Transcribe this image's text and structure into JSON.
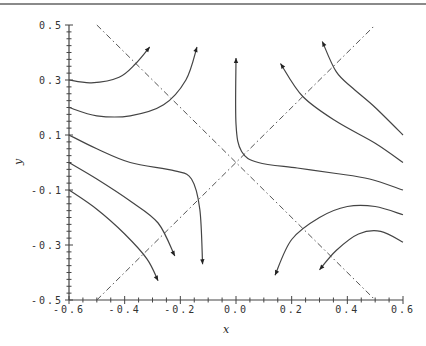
{
  "chart_data": {
    "type": "line",
    "title": "",
    "xlabel": "x",
    "ylabel": "y",
    "xlim": [
      -0.6,
      0.6
    ],
    "ylim": [
      -0.5,
      0.5
    ],
    "grid": false,
    "legend": null,
    "x_ticks": [
      "-0.6",
      "-0.4",
      "-0.2",
      "0.0",
      "0.2",
      "0.4",
      "0.6"
    ],
    "y_ticks": [
      "0.5",
      "0.3",
      "0.1",
      "-0.1",
      "-0.3",
      "-0.5"
    ],
    "reference_lines": [
      {
        "name": "y = x",
        "style": "dash-dot",
        "points": [
          [
            -0.5,
            -0.5
          ],
          [
            0.5,
            0.5
          ]
        ]
      },
      {
        "name": "y = -x",
        "style": "dash-dot",
        "points": [
          [
            -0.5,
            0.5
          ],
          [
            0.5,
            -0.5
          ]
        ]
      }
    ],
    "series": [
      {
        "name": "trajectory-1",
        "arrow": "end",
        "points": [
          [
            -0.6,
            0.3
          ],
          [
            -0.52,
            0.29
          ],
          [
            -0.42,
            0.31
          ],
          [
            -0.36,
            0.36
          ],
          [
            -0.31,
            0.42
          ]
        ]
      },
      {
        "name": "trajectory-2",
        "arrow": "end",
        "points": [
          [
            -0.6,
            0.2
          ],
          [
            -0.5,
            0.17
          ],
          [
            -0.38,
            0.17
          ],
          [
            -0.26,
            0.21
          ],
          [
            -0.18,
            0.3
          ],
          [
            -0.14,
            0.42
          ]
        ]
      },
      {
        "name": "trajectory-3",
        "arrow": "end",
        "points": [
          [
            -0.6,
            0.1
          ],
          [
            -0.5,
            0.05
          ],
          [
            -0.38,
            0.0
          ],
          [
            -0.22,
            -0.03
          ],
          [
            -0.16,
            -0.06
          ],
          [
            -0.13,
            -0.17
          ],
          [
            -0.12,
            -0.37
          ]
        ]
      },
      {
        "name": "trajectory-4",
        "arrow": "end",
        "points": [
          [
            -0.6,
            0.0
          ],
          [
            -0.5,
            -0.06
          ],
          [
            -0.38,
            -0.14
          ],
          [
            -0.28,
            -0.22
          ],
          [
            -0.22,
            -0.34
          ]
        ]
      },
      {
        "name": "trajectory-5",
        "arrow": "end",
        "points": [
          [
            -0.6,
            -0.1
          ],
          [
            -0.5,
            -0.17
          ],
          [
            -0.4,
            -0.26
          ],
          [
            -0.32,
            -0.35
          ],
          [
            -0.28,
            -0.43
          ]
        ]
      },
      {
        "name": "trajectory-6",
        "arrow": "end",
        "points": [
          [
            0.6,
            0.1
          ],
          [
            0.5,
            0.2
          ],
          [
            0.42,
            0.27
          ],
          [
            0.36,
            0.33
          ],
          [
            0.31,
            0.44
          ]
        ]
      },
      {
        "name": "trajectory-7",
        "arrow": "end",
        "points": [
          [
            0.6,
            0.0
          ],
          [
            0.5,
            0.07
          ],
          [
            0.36,
            0.15
          ],
          [
            0.24,
            0.24
          ],
          [
            0.16,
            0.36
          ]
        ]
      },
      {
        "name": "trajectory-8",
        "arrow": "end",
        "points": [
          [
            0.6,
            -0.1
          ],
          [
            0.48,
            -0.06
          ],
          [
            0.36,
            -0.04
          ],
          [
            0.22,
            -0.02
          ],
          [
            0.08,
            0.0
          ],
          [
            0.02,
            0.04
          ],
          [
            0.0,
            0.14
          ],
          [
            0.0,
            0.38
          ]
        ]
      },
      {
        "name": "trajectory-9",
        "arrow": "end",
        "points": [
          [
            0.6,
            -0.19
          ],
          [
            0.5,
            -0.16
          ],
          [
            0.4,
            -0.16
          ],
          [
            0.3,
            -0.2
          ],
          [
            0.2,
            -0.28
          ],
          [
            0.14,
            -0.41
          ]
        ]
      },
      {
        "name": "trajectory-10",
        "arrow": "end",
        "points": [
          [
            0.6,
            -0.29
          ],
          [
            0.52,
            -0.25
          ],
          [
            0.44,
            -0.26
          ],
          [
            0.36,
            -0.32
          ],
          [
            0.3,
            -0.39
          ]
        ]
      }
    ]
  }
}
